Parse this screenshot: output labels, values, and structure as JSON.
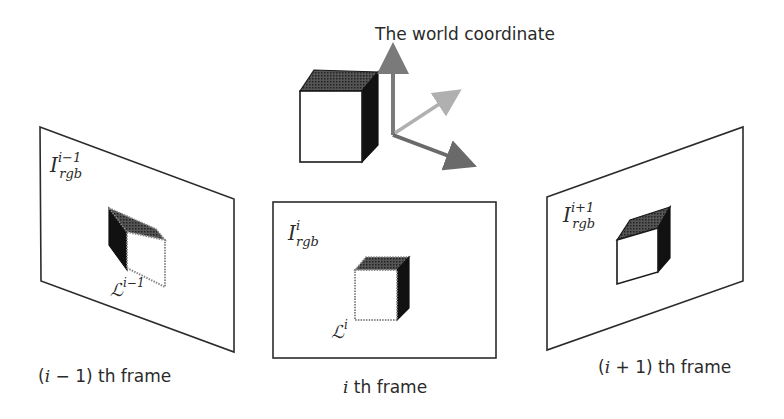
{
  "title": "The world coordinate",
  "world": {
    "cube_icon": "cube",
    "axes_icon": "3d-axes",
    "axis_colors": {
      "up": "#7a7a7a",
      "diagonal": "#b0b0b0",
      "right": "#6a6a6a"
    }
  },
  "frames": [
    {
      "id": "prev",
      "image_symbol": "I",
      "image_sub": "rgb",
      "image_sup": "i−1",
      "label_symbol": "ℒ",
      "label_sup": "i−1",
      "caption": "(i − 1) th frame"
    },
    {
      "id": "current",
      "image_symbol": "I",
      "image_sub": "rgb",
      "image_sup": "i",
      "label_symbol": "ℒ",
      "label_sup": "i",
      "caption": "i th frame"
    },
    {
      "id": "next",
      "image_symbol": "I",
      "image_sub": "rgb",
      "image_sup": "i+1",
      "caption": "(i + 1) th frame"
    }
  ],
  "captions": {
    "prev_pre": "(",
    "prev_var": "i",
    "prev_post": " − 1) th frame",
    "cur_var": "i",
    "cur_post": " th frame",
    "next_pre": "(",
    "next_var": "i",
    "next_post": " + 1) th frame"
  }
}
